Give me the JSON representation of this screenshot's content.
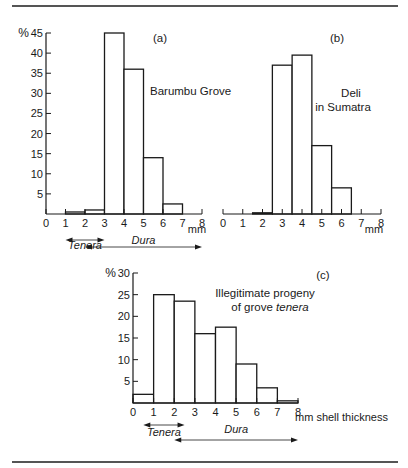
{
  "chart_data": [
    {
      "id": "a",
      "type": "bar",
      "panel_label": "(a)",
      "title": "Barumbu Grove",
      "xlabel": "mm",
      "ylabel": "%",
      "x_ticks": [
        0,
        1,
        2,
        3,
        4,
        5,
        6,
        7,
        8
      ],
      "y_ticks": [
        5,
        10,
        15,
        20,
        25,
        30,
        35,
        40,
        45
      ],
      "xlim": [
        0,
        8
      ],
      "ylim": [
        0,
        45
      ],
      "bins": [
        [
          1,
          2
        ],
        [
          2,
          3
        ],
        [
          3,
          4
        ],
        [
          4,
          5
        ],
        [
          5,
          6
        ],
        [
          6,
          7
        ]
      ],
      "values": [
        0.5,
        1,
        45,
        36,
        14,
        2.5
      ],
      "annotations": [
        {
          "text": "Tenera",
          "range": [
            1,
            3
          ],
          "style": "italic",
          "arrow": "both"
        },
        {
          "text": "Dura",
          "range": [
            2,
            8
          ],
          "style": "italic",
          "arrow": "both"
        }
      ]
    },
    {
      "id": "b",
      "type": "bar",
      "panel_label": "(b)",
      "title": "Deli in Sumatra",
      "title_lines": [
        "Deli",
        "in Sumatra"
      ],
      "xlabel": "mm",
      "x_ticks": [
        0,
        1,
        2,
        3,
        4,
        5,
        6,
        7,
        8
      ],
      "xlim": [
        0,
        8
      ],
      "ylim": [
        0,
        45
      ],
      "bins": [
        [
          1.5,
          2.5
        ],
        [
          2.5,
          3.5
        ],
        [
          3.5,
          4.5
        ],
        [
          4.5,
          5.5
        ],
        [
          5.5,
          6.5
        ]
      ],
      "values": [
        0.3,
        37,
        39.5,
        17,
        6.5
      ]
    },
    {
      "id": "c",
      "type": "bar",
      "panel_label": "(c)",
      "title": "Illegitimate progeny of grove tenera",
      "title_lines": [
        "Illegitimate progeny",
        "of grove ",
        "tenera"
      ],
      "xlabel": "mm shell thickness",
      "ylabel": "%",
      "x_ticks": [
        0,
        1,
        2,
        3,
        4,
        5,
        6,
        7,
        8
      ],
      "y_ticks": [
        5,
        10,
        15,
        20,
        25,
        30
      ],
      "xlim": [
        0,
        8
      ],
      "ylim": [
        0,
        30
      ],
      "bins": [
        [
          0,
          1
        ],
        [
          1,
          2
        ],
        [
          2,
          3
        ],
        [
          3,
          4
        ],
        [
          4,
          5
        ],
        [
          5,
          6
        ],
        [
          6,
          7
        ],
        [
          7,
          8
        ]
      ],
      "values": [
        2,
        25,
        23.5,
        16,
        17.5,
        9,
        3.5,
        0.5
      ],
      "annotations": [
        {
          "text": "Tenera",
          "range": [
            0.5,
            2.5
          ],
          "style": "italic",
          "arrow": "both"
        },
        {
          "text": "Dura",
          "range": [
            2,
            8
          ],
          "style": "italic",
          "arrow": "both"
        }
      ]
    }
  ]
}
